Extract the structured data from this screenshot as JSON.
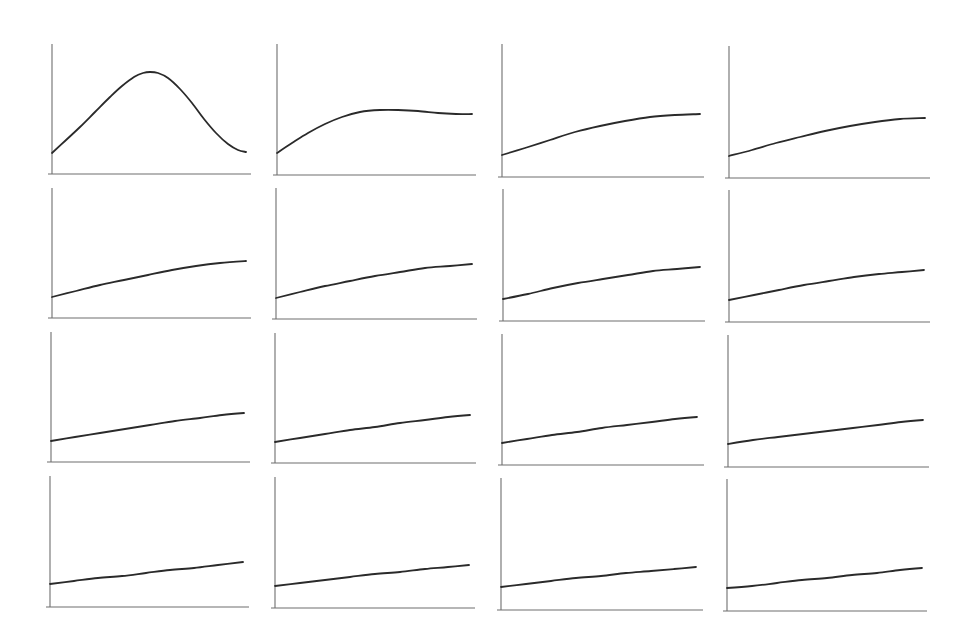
{
  "chart_data": {
    "type": "line",
    "layout": "small-multiples grid, 4 rows x 4 columns",
    "title": "",
    "xlabel": "",
    "ylabel": "",
    "grid": false,
    "legend": null,
    "ticks": "none",
    "colors": {
      "axis": "#6e6e6e",
      "line": "#2a2a2a",
      "background": "#ffffff"
    },
    "panels": [
      {
        "row": 0,
        "col": 0,
        "shape": "bell peak then fall",
        "axis": {
          "x0": 52,
          "y0": 174,
          "xEnd": 251,
          "yTop": 44
        },
        "points": [
          [
            52,
            153
          ],
          [
            65,
            141
          ],
          [
            80,
            127
          ],
          [
            95,
            112
          ],
          [
            110,
            97
          ],
          [
            122,
            86
          ],
          [
            134,
            77
          ],
          [
            143,
            73
          ],
          [
            150,
            72
          ],
          [
            158,
            73
          ],
          [
            168,
            78
          ],
          [
            180,
            89
          ],
          [
            192,
            103
          ],
          [
            204,
            119
          ],
          [
            216,
            133
          ],
          [
            228,
            144
          ],
          [
            238,
            150
          ],
          [
            246,
            152
          ]
        ]
      },
      {
        "row": 0,
        "col": 1,
        "shape": "rise, slight peak, plateau",
        "axis": {
          "x0": 277,
          "y0": 175,
          "xEnd": 476,
          "yTop": 44
        },
        "points": [
          [
            277,
            153
          ],
          [
            292,
            143
          ],
          [
            308,
            133
          ],
          [
            325,
            124
          ],
          [
            342,
            117
          ],
          [
            360,
            112
          ],
          [
            380,
            110
          ],
          [
            398,
            110
          ],
          [
            418,
            111
          ],
          [
            438,
            113
          ],
          [
            456,
            114
          ],
          [
            472,
            114
          ]
        ]
      },
      {
        "row": 0,
        "col": 2,
        "shape": "saturating rise",
        "axis": {
          "x0": 502,
          "y0": 177,
          "xEnd": 704,
          "yTop": 44
        },
        "points": [
          [
            502,
            155
          ],
          [
            525,
            148
          ],
          [
            550,
            140
          ],
          [
            575,
            132
          ],
          [
            600,
            126
          ],
          [
            625,
            121
          ],
          [
            650,
            117
          ],
          [
            675,
            115
          ],
          [
            700,
            114
          ]
        ]
      },
      {
        "row": 0,
        "col": 3,
        "shape": "saturating rise",
        "axis": {
          "x0": 729,
          "y0": 178,
          "xEnd": 930,
          "yTop": 46
        },
        "points": [
          [
            729,
            156
          ],
          [
            752,
            150
          ],
          [
            776,
            143
          ],
          [
            800,
            137
          ],
          [
            825,
            131
          ],
          [
            850,
            126
          ],
          [
            875,
            122
          ],
          [
            900,
            119
          ],
          [
            925,
            118
          ]
        ]
      },
      {
        "row": 1,
        "col": 0,
        "shape": "gentle concave rise",
        "axis": {
          "x0": 52,
          "y0": 318,
          "xEnd": 251,
          "yTop": 188
        },
        "points": [
          [
            52,
            297
          ],
          [
            76,
            291
          ],
          [
            100,
            285
          ],
          [
            124,
            280
          ],
          [
            148,
            275
          ],
          [
            172,
            270
          ],
          [
            196,
            266
          ],
          [
            220,
            263
          ],
          [
            246,
            261
          ]
        ]
      },
      {
        "row": 1,
        "col": 1,
        "shape": "gentle concave rise",
        "axis": {
          "x0": 276,
          "y0": 319,
          "xEnd": 477,
          "yTop": 188
        },
        "points": [
          [
            276,
            298
          ],
          [
            300,
            292
          ],
          [
            325,
            286
          ],
          [
            350,
            281
          ],
          [
            375,
            276
          ],
          [
            400,
            272
          ],
          [
            425,
            268
          ],
          [
            450,
            266
          ],
          [
            472,
            264
          ]
        ]
      },
      {
        "row": 1,
        "col": 2,
        "shape": "gentle concave rise",
        "axis": {
          "x0": 503,
          "y0": 321,
          "xEnd": 705,
          "yTop": 189
        },
        "points": [
          [
            503,
            299
          ],
          [
            528,
            294
          ],
          [
            553,
            288
          ],
          [
            578,
            283
          ],
          [
            603,
            279
          ],
          [
            628,
            275
          ],
          [
            653,
            271
          ],
          [
            677,
            269
          ],
          [
            700,
            267
          ]
        ]
      },
      {
        "row": 1,
        "col": 3,
        "shape": "gentle concave rise",
        "axis": {
          "x0": 729,
          "y0": 322,
          "xEnd": 930,
          "yTop": 190
        },
        "points": [
          [
            729,
            300
          ],
          [
            754,
            295
          ],
          [
            779,
            290
          ],
          [
            804,
            285
          ],
          [
            829,
            281
          ],
          [
            854,
            277
          ],
          [
            879,
            274
          ],
          [
            902,
            272
          ],
          [
            924,
            270
          ]
        ]
      },
      {
        "row": 2,
        "col": 0,
        "shape": "near-linear rise",
        "axis": {
          "x0": 51,
          "y0": 462,
          "xEnd": 250,
          "yTop": 332
        },
        "points": [
          [
            51,
            441
          ],
          [
            75,
            437
          ],
          [
            100,
            433
          ],
          [
            125,
            429
          ],
          [
            150,
            425
          ],
          [
            175,
            421
          ],
          [
            200,
            418
          ],
          [
            222,
            415
          ],
          [
            244,
            413
          ]
        ]
      },
      {
        "row": 2,
        "col": 1,
        "shape": "near-linear rise",
        "axis": {
          "x0": 275,
          "y0": 463,
          "xEnd": 476,
          "yTop": 333
        },
        "points": [
          [
            275,
            442
          ],
          [
            300,
            438
          ],
          [
            325,
            434
          ],
          [
            350,
            430
          ],
          [
            375,
            427
          ],
          [
            400,
            423
          ],
          [
            425,
            420
          ],
          [
            448,
            417
          ],
          [
            470,
            415
          ]
        ]
      },
      {
        "row": 2,
        "col": 2,
        "shape": "near-linear rise",
        "axis": {
          "x0": 502,
          "y0": 465,
          "xEnd": 704,
          "yTop": 334
        },
        "points": [
          [
            502,
            443
          ],
          [
            527,
            439
          ],
          [
            552,
            435
          ],
          [
            577,
            432
          ],
          [
            602,
            428
          ],
          [
            627,
            425
          ],
          [
            652,
            422
          ],
          [
            675,
            419
          ],
          [
            697,
            417
          ]
        ]
      },
      {
        "row": 2,
        "col": 3,
        "shape": "near-linear rise",
        "axis": {
          "x0": 728,
          "y0": 467,
          "xEnd": 929,
          "yTop": 335
        },
        "points": [
          [
            728,
            444
          ],
          [
            753,
            440
          ],
          [
            778,
            437
          ],
          [
            803,
            434
          ],
          [
            828,
            431
          ],
          [
            853,
            428
          ],
          [
            878,
            425
          ],
          [
            901,
            422
          ],
          [
            923,
            420
          ]
        ]
      },
      {
        "row": 3,
        "col": 0,
        "shape": "shallow linear rise",
        "axis": {
          "x0": 50,
          "y0": 607,
          "xEnd": 249,
          "yTop": 476
        },
        "points": [
          [
            50,
            584
          ],
          [
            74,
            581
          ],
          [
            98,
            578
          ],
          [
            122,
            576
          ],
          [
            146,
            573
          ],
          [
            170,
            570
          ],
          [
            194,
            568
          ],
          [
            218,
            565
          ],
          [
            243,
            562
          ]
        ]
      },
      {
        "row": 3,
        "col": 1,
        "shape": "shallow linear rise",
        "axis": {
          "x0": 275,
          "y0": 608,
          "xEnd": 475,
          "yTop": 477
        },
        "points": [
          [
            275,
            586
          ],
          [
            300,
            583
          ],
          [
            325,
            580
          ],
          [
            350,
            577
          ],
          [
            375,
            574
          ],
          [
            400,
            572
          ],
          [
            425,
            569
          ],
          [
            448,
            567
          ],
          [
            469,
            565
          ]
        ]
      },
      {
        "row": 3,
        "col": 2,
        "shape": "shallow linear rise",
        "axis": {
          "x0": 501,
          "y0": 610,
          "xEnd": 703,
          "yTop": 478
        },
        "points": [
          [
            501,
            587
          ],
          [
            526,
            584
          ],
          [
            551,
            581
          ],
          [
            576,
            578
          ],
          [
            601,
            576
          ],
          [
            626,
            573
          ],
          [
            651,
            571
          ],
          [
            674,
            569
          ],
          [
            696,
            567
          ]
        ]
      },
      {
        "row": 3,
        "col": 3,
        "shape": "shallow linear rise",
        "axis": {
          "x0": 727,
          "y0": 611,
          "xEnd": 927,
          "yTop": 479
        },
        "points": [
          [
            727,
            588
          ],
          [
            752,
            586
          ],
          [
            777,
            583
          ],
          [
            802,
            580
          ],
          [
            827,
            578
          ],
          [
            852,
            575
          ],
          [
            877,
            573
          ],
          [
            900,
            570
          ],
          [
            922,
            568
          ]
        ]
      }
    ]
  }
}
